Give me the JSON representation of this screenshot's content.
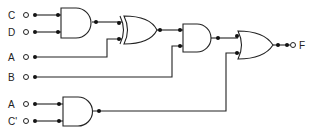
{
  "diagram": {
    "type": "logic-circuit",
    "inputs": [
      {
        "label": "C",
        "y": 15
      },
      {
        "label": "D",
        "y": 32
      },
      {
        "label": "A",
        "y": 57
      },
      {
        "label": "B",
        "y": 77
      },
      {
        "label": "A",
        "y": 104
      },
      {
        "label": "C'",
        "y": 121
      }
    ],
    "gates": [
      {
        "id": "and1",
        "type": "AND",
        "inputs": [
          "C",
          "D"
        ]
      },
      {
        "id": "xor1",
        "type": "XOR",
        "inputs": [
          "and1",
          "A"
        ]
      },
      {
        "id": "and2",
        "type": "AND",
        "inputs": [
          "xor1",
          "B"
        ]
      },
      {
        "id": "and3",
        "type": "AND",
        "inputs": [
          "A",
          "C'"
        ]
      },
      {
        "id": "or1",
        "type": "OR",
        "inputs": [
          "and2",
          "and3"
        ]
      }
    ],
    "output": {
      "label": "F"
    }
  }
}
